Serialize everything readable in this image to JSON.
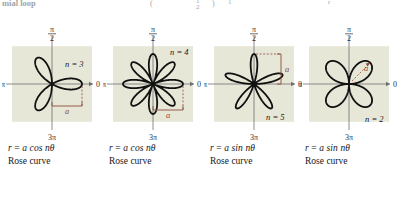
{
  "figure": {
    "kind": "rose-curve-reference-table",
    "background_color": "#ffffff",
    "panel_fill": "#e7e7d8",
    "curve_color": "#111111",
    "annotation_color": "#8d4a3c",
    "axis_color": "#6f6f72"
  },
  "top_strip": {
    "fragments": [
      {
        "text": "mial loop",
        "x": 2,
        "y": -2,
        "size": 8.5,
        "bold": true
      },
      {
        "text": "(",
        "x": 150,
        "y": -1,
        "size": 8,
        "bold": false
      },
      {
        "text": "1",
        "x": 196,
        "y": -3,
        "size": 7,
        "bold": false
      },
      {
        "text": "2",
        "x": 196,
        "y": 3,
        "size": 7,
        "bold": false
      },
      {
        "text": ")",
        "x": 212,
        "y": -1,
        "size": 8,
        "bold": false
      },
      {
        "text": "1",
        "x": 228,
        "y": -2,
        "size": 7,
        "bold": false
      },
      {
        "text": "r",
        "x": 328,
        "y": -2,
        "size": 7,
        "bold": false
      }
    ]
  },
  "axis_labels": {
    "top_numerator": "π",
    "top_denominator": "2",
    "left": "π",
    "right": "0",
    "bottom_numerator": "3π",
    "bottom_denominator": "2"
  },
  "panels": [
    {
      "id": "panel-1",
      "n_label": "n = 3",
      "n_value": 3,
      "petals": 3,
      "function": "cos",
      "phase_deg": 0,
      "a_label": "a",
      "a_marker": "horizontal-bracket-bottom-right",
      "equation_r": "r",
      "equation_eq": "=",
      "equation_rhs": "a cos nθ",
      "equation_theta": "θ",
      "caption": "Rose curve"
    },
    {
      "id": "panel-2",
      "n_label": "n = 4",
      "n_value": 4,
      "petals": 8,
      "function": "cos",
      "phase_deg": 0,
      "a_label": "a",
      "a_marker": "horizontal-bracket-bottom-right",
      "equation_r": "r",
      "equation_eq": "=",
      "equation_rhs": "a cos nθ",
      "equation_theta": "θ",
      "caption": "Rose curve"
    },
    {
      "id": "panel-3",
      "n_label": "n = 5",
      "n_value": 5,
      "petals": 5,
      "function": "sin",
      "phase_deg": 90,
      "a_label": "a",
      "a_marker": "vertical-bracket-upper-right",
      "equation_r": "r",
      "equation_eq": "=",
      "equation_rhs": "a sin nθ",
      "equation_theta": "θ",
      "caption": "Rose curve"
    },
    {
      "id": "panel-4",
      "n_label": "n = 2",
      "n_value": 2,
      "petals": 4,
      "function": "sin",
      "phase_deg": 45,
      "a_label": "a",
      "a_marker": "diagonal-arrow-upper-right-petal",
      "equation_r": "r",
      "equation_eq": "=",
      "equation_rhs": "a sin nθ",
      "equation_theta": "θ",
      "caption": "Rose curve"
    }
  ],
  "chart_data": {
    "type": "line",
    "xlabel": "",
    "ylabel": "",
    "coordinate_system": "polar",
    "grid": false,
    "legend": "none",
    "axis_ticks": [
      "0",
      "π/2",
      "π",
      "3π/2"
    ],
    "series": [
      {
        "name": "r = a cos 3θ",
        "n": 3,
        "function": "cos",
        "petal_count": 3,
        "amplitude": 1.0
      },
      {
        "name": "r = a cos 4θ",
        "n": 4,
        "function": "cos",
        "petal_count": 8,
        "amplitude": 1.0
      },
      {
        "name": "r = a sin 5θ",
        "n": 5,
        "function": "sin",
        "petal_count": 5,
        "amplitude": 1.0
      },
      {
        "name": "r = a sin 2θ",
        "n": 2,
        "function": "sin",
        "petal_count": 4,
        "amplitude": 1.0
      }
    ]
  }
}
